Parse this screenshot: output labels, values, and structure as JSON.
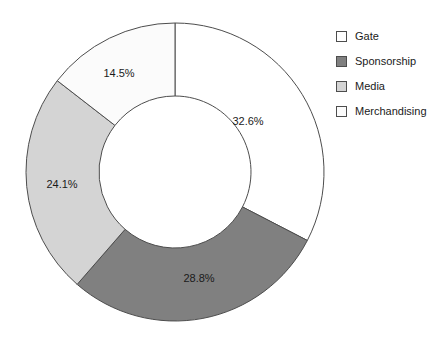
{
  "chart_data": {
    "type": "pie",
    "variant": "donut",
    "title": "",
    "subtitle": "",
    "xlabel": "",
    "ylabel": "",
    "grid": false,
    "legend_position": "top-right",
    "start_angle_deg": 0,
    "direction": "clockwise",
    "center": {
      "x": 175,
      "y": 172
    },
    "outer_radius": 149,
    "inner_radius": 76,
    "categories": [
      "Gate",
      "Sponsorship",
      "Media",
      "Merchandising"
    ],
    "values": [
      32.6,
      28.8,
      24.1,
      14.5
    ],
    "labels": [
      "32.6%",
      "28.8%",
      "24.1%",
      "14.5%"
    ],
    "colors": [
      "#ffffff",
      "#808080",
      "#d4d4d4",
      "#fbfbfb"
    ],
    "slice_border_color": "#4d4d4d",
    "slices": [
      {
        "name": "Gate",
        "value": 32.6,
        "label": "32.6%",
        "color": "#ffffff",
        "label_x": 248,
        "label_y": 122
      },
      {
        "name": "Sponsorship",
        "value": 28.8,
        "label": "28.8%",
        "color": "#808080",
        "label_x": 199,
        "label_y": 279
      },
      {
        "name": "Media",
        "value": 24.1,
        "label": "24.1%",
        "color": "#d4d4d4",
        "label_x": 62,
        "label_y": 185
      },
      {
        "name": "Merchandising",
        "value": 14.5,
        "label": "14.5%",
        "color": "#fbfbfb",
        "label_x": 119,
        "label_y": 74
      }
    ]
  },
  "legend": {
    "items": [
      {
        "label": "Gate",
        "color": "#ffffff"
      },
      {
        "label": "Sponsorship",
        "color": "#808080"
      },
      {
        "label": "Media",
        "color": "#d4d4d4"
      },
      {
        "label": "Merchandising",
        "color": "#fbfbfb"
      }
    ]
  }
}
